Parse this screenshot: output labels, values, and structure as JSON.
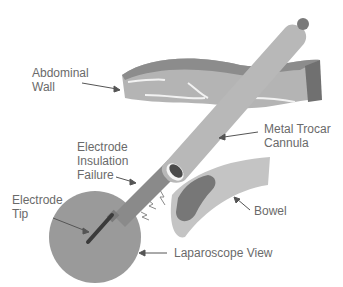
{
  "labels": {
    "abdominal_wall": "Abdominal\nWall",
    "metal_trocar_cannula": "Metal Trocar\nCannula",
    "electrode_insulation_failure": "Electrode\nInsulation\nFailure",
    "electrode_tip": "Electrode\nTip",
    "bowel": "Bowel",
    "laparoscope_view": "Laparoscope View"
  },
  "colors": {
    "background": "#ffffff",
    "label_text": "#6a6a6a",
    "arrow": "#555555",
    "abdominal_wall_top": "#8c8c8c",
    "abdominal_wall_face": "#b4b4b4",
    "abdominal_wall_side": "#707070",
    "cannula": "#b8b8b8",
    "cannula_cap": "#7a7a7a",
    "electrode_shaft": "#8a8a8a",
    "laparoscope_view": "#9a9a9a",
    "electrode_tip": "#3a3a3a",
    "bowel": "#c4c4c4",
    "bowel_burn": "#777777"
  }
}
